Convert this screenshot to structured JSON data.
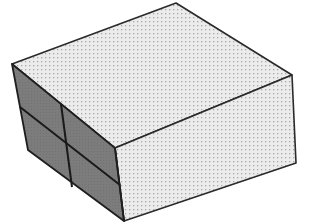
{
  "diagram": {
    "type": "isometric-box",
    "colors": {
      "background": "#ffffff",
      "light_face": "#ececec",
      "dot": "#a8a8a8",
      "dark_face": "#7c7c7c",
      "edge": "#2a2a2a"
    },
    "vertices": {
      "left_top": [
        12,
        64
      ],
      "back_top": [
        176,
        3
      ],
      "right_top": [
        292,
        75
      ],
      "front_top": [
        115,
        148
      ],
      "right_bottom": [
        296,
        163
      ],
      "front_bottom": [
        124,
        221
      ],
      "left_bottom": [
        28,
        150
      ]
    },
    "faces": [
      {
        "name": "top-face",
        "points": "12,64 176,3 292,75 115,148",
        "fill": "light"
      },
      {
        "name": "right-face",
        "points": "115,148 292,75 296,163 124,221",
        "fill": "light"
      },
      {
        "name": "left-face",
        "points": "12,64 115,148 124,221 28,150",
        "fill": "dark"
      }
    ],
    "grid_lines": [
      {
        "name": "left-face-vertical-divider",
        "x1": 61,
        "y1": 104,
        "x2": 72,
        "y2": 187
      },
      {
        "name": "left-face-horizontal-divider",
        "x1": 20,
        "y1": 107,
        "x2": 120,
        "y2": 185
      }
    ]
  }
}
